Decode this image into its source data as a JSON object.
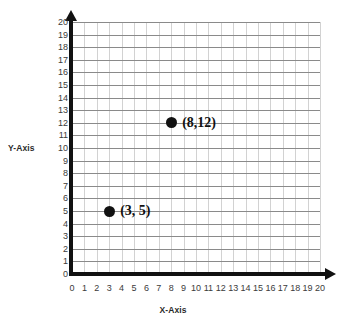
{
  "chart_data": {
    "type": "scatter",
    "title": "",
    "xlabel": "X-Axis",
    "ylabel": "Y-Axis",
    "xlim": [
      0,
      20
    ],
    "ylim": [
      0,
      20
    ],
    "xticks": [
      0,
      1,
      2,
      3,
      4,
      5,
      6,
      7,
      8,
      9,
      10,
      11,
      12,
      13,
      14,
      15,
      16,
      17,
      18,
      19,
      20
    ],
    "yticks": [
      0,
      1,
      2,
      3,
      4,
      5,
      6,
      7,
      8,
      9,
      10,
      11,
      12,
      13,
      14,
      15,
      16,
      17,
      18,
      19,
      20
    ],
    "grid": true,
    "legend": "none",
    "points": [
      {
        "x": 8,
        "y": 12,
        "label": "(8,12)"
      },
      {
        "x": 3,
        "y": 5,
        "label": "(3, 5)"
      }
    ],
    "colors": {
      "marker": "#111111",
      "axis": "#111111",
      "gridline_horizontal": "#8a8a8a",
      "gridline_vertical": "#d2d2d2",
      "tick_text": "#3b3b3b",
      "background": "#ffffff"
    }
  }
}
